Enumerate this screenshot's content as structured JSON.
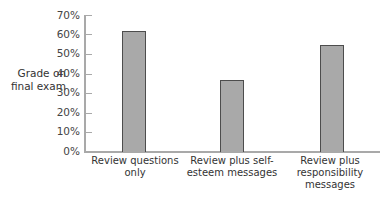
{
  "chart_data": {
    "type": "bar",
    "title": "",
    "xlabel": "",
    "ylabel": "Grade on final exam",
    "categories": [
      "Review questions only",
      "Review plus self-esteem messages",
      "Review plus responsibility messages"
    ],
    "category_lines": [
      [
        "Review questions",
        "only"
      ],
      [
        "Review plus self-",
        "esteem messages"
      ],
      [
        "Review plus",
        "responsibility",
        "messages"
      ]
    ],
    "values": [
      62,
      37,
      55
    ],
    "ylim": [
      0,
      70
    ],
    "yticks": [
      "0%",
      "10%",
      "20%",
      "30%",
      "40%",
      "50%",
      "60%",
      "70%"
    ],
    "grid": false,
    "legend": null,
    "colors": {
      "bar_fill": "#a9a9a9",
      "bar_border": "#4d4d4d",
      "axis": "#a9a9a9"
    }
  },
  "axis": {
    "ylabel_line1": "Grade on",
    "ylabel_line2": "final exam"
  }
}
